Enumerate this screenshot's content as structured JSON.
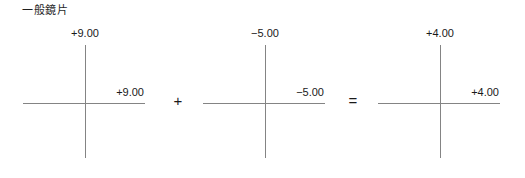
{
  "figure": {
    "title": "一般鏡片",
    "background_color": "#ffffff",
    "line_color": "#848484",
    "text_color": "#1a1a1a"
  },
  "crosses": [
    {
      "name": "first-lens-cross",
      "vertical_power": "+9.00",
      "horizontal_power": "+9.00"
    },
    {
      "name": "second-lens-cross",
      "vertical_power": "−5.00",
      "horizontal_power": "−5.00"
    },
    {
      "name": "result-lens-cross",
      "vertical_power": "+4.00",
      "horizontal_power": "+4.00"
    }
  ],
  "operators": {
    "plus": "+",
    "equals": "="
  }
}
